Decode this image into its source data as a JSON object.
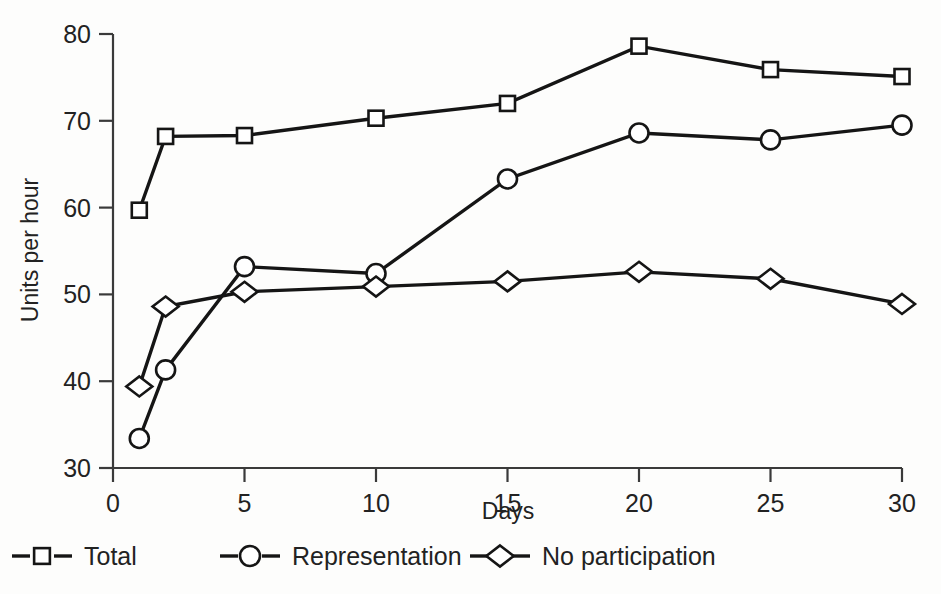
{
  "chart_data": {
    "type": "line",
    "title": "",
    "xlabel": "Days",
    "ylabel": "Units per hour",
    "x": [
      1,
      2,
      5,
      10,
      15,
      20,
      25,
      30
    ],
    "xlim": [
      0,
      30
    ],
    "ylim": [
      30,
      80
    ],
    "xticks": [
      "0",
      "5",
      "10",
      "15",
      "20",
      "25",
      "30"
    ],
    "xtick_values": [
      0,
      5,
      10,
      15,
      20,
      25,
      30
    ],
    "yticks": [
      "30",
      "40",
      "50",
      "60",
      "70",
      "80"
    ],
    "ytick_values": [
      30,
      40,
      50,
      60,
      70,
      80
    ],
    "grid": false,
    "legend_position": "below-axes",
    "series": [
      {
        "name": "Total",
        "marker": "square",
        "color": "#151515",
        "values": [
          59.7,
          68.2,
          68.3,
          70.3,
          72.0,
          78.6,
          75.9,
          75.1
        ]
      },
      {
        "name": "Representation",
        "marker": "circle",
        "color": "#151515",
        "values": [
          33.4,
          41.3,
          53.2,
          52.4,
          63.3,
          68.6,
          67.8,
          69.5
        ]
      },
      {
        "name": "No participation",
        "marker": "diamond",
        "color": "#151515",
        "values": [
          39.4,
          48.6,
          50.3,
          50.9,
          51.5,
          52.6,
          51.8,
          48.9
        ]
      }
    ]
  },
  "axes": {
    "y_axis_title": "Units per hour",
    "x_axis_title": "Days"
  },
  "legend": {
    "items": [
      {
        "label": "Total",
        "marker": "square"
      },
      {
        "label": "Representation",
        "marker": "circle"
      },
      {
        "label": "No participation",
        "marker": "diamond"
      }
    ]
  }
}
